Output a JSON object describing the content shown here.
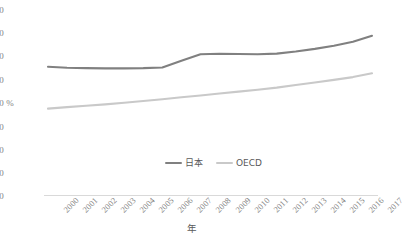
{
  "chart_data": {
    "type": "line",
    "title": "",
    "xlabel": "年",
    "ylabel": "%",
    "ylim": [
      0,
      80
    ],
    "ytick_step": 10,
    "yticks": [
      "80",
      "70",
      "60",
      "50",
      "40",
      "30",
      "20",
      "10",
      "0"
    ],
    "grid": false,
    "legend_position": "bottom-center",
    "categories": [
      "2000",
      "2001",
      "2002",
      "2003",
      "2004",
      "2005",
      "2006",
      "2007",
      "2008",
      "2009",
      "2010",
      "2011",
      "2012",
      "2013",
      "2014",
      "2015",
      "2016",
      "2017"
    ],
    "series": [
      {
        "name": "日本",
        "color": "#808080",
        "values": [
          55.0,
          54.6,
          54.4,
          54.3,
          54.3,
          54.4,
          54.7,
          57.6,
          60.3,
          60.5,
          60.4,
          60.3,
          60.6,
          61.5,
          62.6,
          63.9,
          65.6,
          68.2
        ]
      },
      {
        "name": "OECD",
        "color": "#c9c9c9",
        "values": [
          37.2,
          37.8,
          38.4,
          39.0,
          39.7,
          40.4,
          41.2,
          42.0,
          42.8,
          43.6,
          44.4,
          45.2,
          46.1,
          47.2,
          48.3,
          49.4,
          50.6,
          52.2
        ]
      }
    ],
    "axis_color": "#d9d9d9"
  },
  "legend": {
    "entries": [
      {
        "label": "日本"
      },
      {
        "label": "OECD"
      }
    ]
  }
}
